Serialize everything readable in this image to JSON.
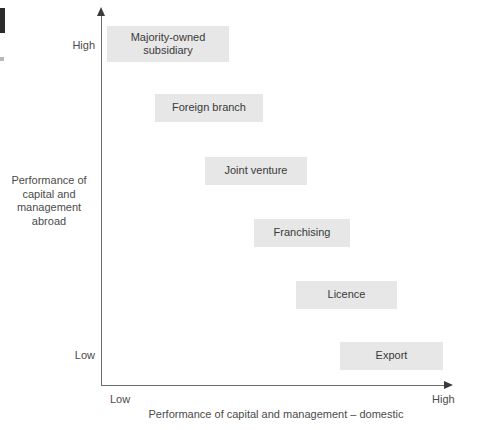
{
  "figure": {
    "type": "scatter-matrix-diagram",
    "background_color": "#ffffff",
    "box_fill_color": "#e7e7e7",
    "axis_color": "#6d6d6d",
    "text_color": "#4b4b4b"
  },
  "axes": {
    "y": {
      "title": "Performance of capital and management abroad",
      "title_lines": [
        "Performance of",
        "capital and",
        "management",
        "abroad"
      ],
      "low_label": "Low",
      "high_label": "High"
    },
    "x": {
      "title": "Performance of capital and management – domestic",
      "low_label": "Low",
      "high_label": "High"
    }
  },
  "entry_modes": [
    {
      "label": "Majority-owned subsidiary",
      "label_lines": [
        "Majority-owned",
        "subsidiary"
      ],
      "x_level": "low",
      "y_level": "high",
      "box": {
        "left": 107,
        "top": 26,
        "width": 122,
        "height": 36
      }
    },
    {
      "label": "Foreign branch",
      "label_lines": [
        "Foreign branch"
      ],
      "x_level": "low-mid",
      "y_level": "mid-high",
      "box": {
        "left": 155,
        "top": 94,
        "width": 108,
        "height": 28
      }
    },
    {
      "label": "Joint venture",
      "label_lines": [
        "Joint venture"
      ],
      "x_level": "mid",
      "y_level": "mid",
      "box": {
        "left": 205,
        "top": 157,
        "width": 102,
        "height": 28
      }
    },
    {
      "label": "Franchising",
      "label_lines": [
        "Franchising"
      ],
      "x_level": "mid-high",
      "y_level": "mid-low",
      "box": {
        "left": 254,
        "top": 219,
        "width": 96,
        "height": 28
      }
    },
    {
      "label": "Licence",
      "label_lines": [
        "Licence"
      ],
      "x_level": "high",
      "y_level": "low-mid",
      "box": {
        "left": 296,
        "top": 281,
        "width": 101,
        "height": 28
      }
    },
    {
      "label": "Export",
      "label_lines": [
        "Export"
      ],
      "x_level": "very-high",
      "y_level": "low",
      "box": {
        "left": 340,
        "top": 342,
        "width": 103,
        "height": 28
      }
    }
  ]
}
